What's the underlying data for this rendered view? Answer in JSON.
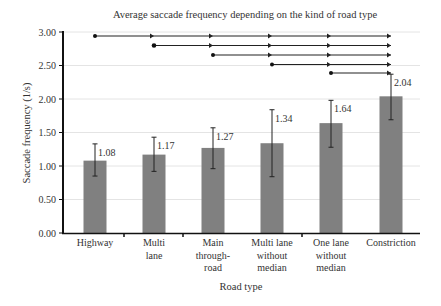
{
  "chart_data": {
    "type": "bar",
    "title": "Average saccade frequency depending on the kind of road type",
    "xlabel": "Road type",
    "ylabel": "Saccade frequency (1/s)",
    "ylim": [
      0,
      3
    ],
    "yticks": [
      "0.00",
      "0.50",
      "1.00",
      "1.50",
      "2.00",
      "2.50",
      "3.00"
    ],
    "grid": true,
    "categories": [
      [
        "Highway"
      ],
      [
        "Multi",
        "lane"
      ],
      [
        "Main",
        "through-",
        "road"
      ],
      [
        "Multi lane",
        "without",
        "median"
      ],
      [
        "One lane",
        "without",
        "median"
      ],
      [
        "Constriction"
      ]
    ],
    "values": [
      1.08,
      1.17,
      1.27,
      1.34,
      1.64,
      2.04
    ],
    "value_labels": [
      "1.08",
      "1.17",
      "1.27",
      "1.34",
      "1.64",
      "2.04"
    ],
    "error_bars": [
      {
        "low": 0.85,
        "high": 1.33
      },
      {
        "low": 0.92,
        "high": 1.43
      },
      {
        "low": 0.96,
        "high": 1.57
      },
      {
        "low": 0.84,
        "high": 1.84
      },
      {
        "low": 1.28,
        "high": 1.98
      },
      {
        "low": 1.69,
        "high": 2.37
      }
    ],
    "significance_arrows": [
      {
        "from": 0,
        "to": [
          1,
          2,
          3,
          4,
          5
        ]
      },
      {
        "from": 1,
        "to": [
          2,
          3,
          4,
          5
        ]
      },
      {
        "from": 2,
        "to": [
          3,
          4,
          5
        ]
      },
      {
        "from": 3,
        "to": [
          4,
          5
        ]
      },
      {
        "from": 4,
        "to": [
          5
        ]
      }
    ],
    "bar_color": "#808080"
  }
}
